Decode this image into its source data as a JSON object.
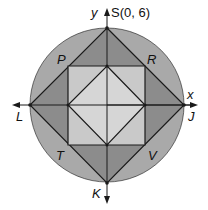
{
  "diagram": {
    "axes": {
      "x_label": "x",
      "y_label": "y"
    },
    "points": {
      "S": "S(0, 6)",
      "J": "J",
      "K": "K",
      "L": "L",
      "P": "P",
      "R": "R",
      "T": "T",
      "V": "V"
    },
    "colors": {
      "circle": "#a9a9a9",
      "outer_triangles": "#8c8c8c",
      "middle_square": "#c9c9c9",
      "inner_diamond": "#d9d9d9",
      "stroke": "#1a1a1a"
    }
  }
}
